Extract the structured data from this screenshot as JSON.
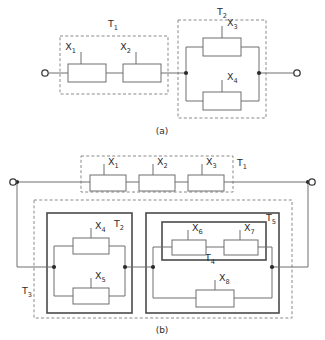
{
  "figure": {
    "captions": {
      "a": "(a)",
      "b": "(b)"
    },
    "colors": {
      "wire": "#6e6e6e",
      "block_stroke": "#6e6e6e",
      "block_fill": "#ffffff",
      "dashed_module": "#8a8a8a",
      "solid_module": "#4a4a4a",
      "node_dot": "#2b2b2b",
      "text": "#2b2b2b",
      "background": "#ffffff"
    }
  },
  "panel_a": {
    "caption": "(a)",
    "terminals": [
      {
        "name": "input-terminal",
        "x": 43,
        "y": 73
      },
      {
        "name": "output-terminal",
        "x": 298,
        "y": 73
      }
    ],
    "modules": [
      {
        "id": "T1",
        "label": "T",
        "sub": "1",
        "style": "dashed",
        "label_x": 113,
        "label_y": 27,
        "x": 60,
        "y": 36,
        "w": 108,
        "h": 58,
        "structure": "series",
        "components": [
          "X1",
          "X2"
        ]
      },
      {
        "id": "T2",
        "label": "T",
        "sub": "2",
        "style": "dashed",
        "label_x": 222,
        "label_y": 15,
        "x": 178,
        "y": 20,
        "w": 88,
        "h": 98,
        "structure": "parallel",
        "components": [
          "X3",
          "X4"
        ]
      }
    ],
    "components": [
      {
        "id": "X1",
        "label": "X",
        "sub": "1",
        "x": 68,
        "y": 64,
        "w": 38,
        "h": 18,
        "lead": "top",
        "label_x": 81,
        "label_y": 52
      },
      {
        "id": "X2",
        "label": "X",
        "sub": "2",
        "x": 123,
        "y": 64,
        "w": 38,
        "h": 18,
        "lead": "top",
        "label_x": 136,
        "label_y": 52
      },
      {
        "id": "X3",
        "label": "X",
        "sub": "3",
        "x": 203,
        "y": 38,
        "w": 38,
        "h": 18,
        "lead": "top",
        "label_x": 225,
        "label_y": 31
      },
      {
        "id": "X4",
        "label": "X",
        "sub": "4",
        "x": 203,
        "y": 92,
        "w": 38,
        "h": 18,
        "lead": "top",
        "label_x": 225,
        "label_y": 85
      }
    ],
    "nodes": [
      {
        "x": 186,
        "y": 73
      },
      {
        "x": 259,
        "y": 73
      }
    ]
  },
  "panel_b": {
    "caption": "(b)",
    "terminals": [
      {
        "name": "input-terminal",
        "x": 13,
        "y": 182
      },
      {
        "name": "output-terminal",
        "x": 312,
        "y": 182
      }
    ],
    "modules": [
      {
        "id": "T1",
        "label": "T",
        "sub": "1",
        "style": "dashed",
        "label_x": 239,
        "label_y": 166,
        "x": 81,
        "y": 156,
        "w": 152,
        "h": 36,
        "structure": "series",
        "components": [
          "X1",
          "X2",
          "X3"
        ]
      },
      {
        "id": "T3",
        "label": "T",
        "sub": "3",
        "style": "dashed",
        "label_x": 28,
        "label_y": 294,
        "x": 34,
        "y": 200,
        "w": 258,
        "h": 118,
        "structure": "series",
        "components": [
          "T2",
          "T5"
        ]
      },
      {
        "id": "T2",
        "label": "T",
        "sub": "2",
        "style": "solid",
        "label_x": 118,
        "label_y": 227,
        "x": 47,
        "y": 213,
        "w": 85,
        "h": 100,
        "structure": "parallel",
        "components": [
          "X4",
          "X5"
        ]
      },
      {
        "id": "T5",
        "label": "T",
        "sub": "5",
        "style": "solid",
        "label_x": 271,
        "label_y": 221,
        "x": 146,
        "y": 213,
        "w": 133,
        "h": 100,
        "structure": "parallel",
        "components": [
          "T4",
          "X8"
        ]
      },
      {
        "id": "T4",
        "label": "T",
        "sub": "4",
        "style": "solid",
        "label_x": 209,
        "label_y": 261,
        "x": 162,
        "y": 222,
        "w": 104,
        "h": 38,
        "structure": "series",
        "components": [
          "X6",
          "X7"
        ]
      }
    ],
    "components": [
      {
        "id": "X1",
        "label": "X",
        "sub": "1",
        "x": 90,
        "y": 175,
        "w": 36,
        "h": 16,
        "lead": "top",
        "label_x": 103,
        "label_y": 166
      },
      {
        "id": "X2",
        "label": "X",
        "sub": "2",
        "x": 139,
        "y": 175,
        "w": 36,
        "h": 16,
        "lead": "top",
        "label_x": 152,
        "label_y": 166
      },
      {
        "id": "X3",
        "label": "X",
        "sub": "3",
        "x": 188,
        "y": 175,
        "w": 36,
        "h": 16,
        "lead": "top",
        "label_x": 201,
        "label_y": 166
      },
      {
        "id": "X4",
        "label": "X",
        "sub": "4",
        "x": 73,
        "y": 238,
        "w": 36,
        "h": 16,
        "lead": "top",
        "label_x": 94,
        "label_y": 231
      },
      {
        "id": "X5",
        "label": "X",
        "sub": "5",
        "x": 73,
        "y": 288,
        "w": 36,
        "h": 16,
        "lead": "top",
        "label_x": 94,
        "label_y": 281
      },
      {
        "id": "X6",
        "label": "X",
        "sub": "6",
        "x": 172,
        "y": 240,
        "w": 34,
        "h": 15,
        "lead": "top",
        "label_x": 190,
        "label_y": 234
      },
      {
        "id": "X7",
        "label": "X",
        "sub": "7",
        "x": 224,
        "y": 240,
        "w": 34,
        "h": 15,
        "lead": "top",
        "label_x": 242,
        "label_y": 234
      },
      {
        "id": "X8",
        "label": "X",
        "sub": "8",
        "x": 196,
        "y": 290,
        "w": 38,
        "h": 17,
        "lead": "top",
        "label_x": 219,
        "label_y": 283
      }
    ],
    "nodes": [
      {
        "x": 17,
        "y": 182
      },
      {
        "x": 308,
        "y": 182
      },
      {
        "x": 54,
        "y": 267
      },
      {
        "x": 125,
        "y": 267
      },
      {
        "x": 153,
        "y": 267
      },
      {
        "x": 272,
        "y": 267
      }
    ]
  }
}
